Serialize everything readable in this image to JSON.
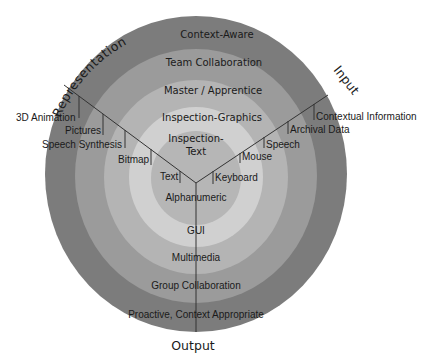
{
  "diagram": {
    "type": "concentric-rings-with-three-axes",
    "colors": {
      "ring1_outer": "#7a7a7a",
      "ring2": "#9a9a9a",
      "ring3": "#b2b2b2",
      "ring4": "#cdcdcd",
      "ring5_inner": "#b4b4b4",
      "lines": "#333333",
      "background": "#ffffff"
    },
    "axes": {
      "representation": "Representation",
      "input": "Input",
      "output": "Output"
    },
    "top_rings": [
      "Context-Aware",
      "Team Collaboration",
      "Master / Apprentice",
      "Inspection-Graphics",
      "Inspection-",
      "Text"
    ],
    "bottom_rings": [
      "Alphanumeric",
      "GUI",
      "Multimedia",
      "Group Collaboration",
      "Proactive, Context Appropriate"
    ],
    "representation_items": [
      "3D Animation",
      "Pictures",
      "Speech Synthesis",
      "Bitmap",
      "Text"
    ],
    "input_items": [
      "Contextual Information",
      "Archival Data",
      "Speech",
      "Mouse",
      "Keyboard"
    ]
  }
}
